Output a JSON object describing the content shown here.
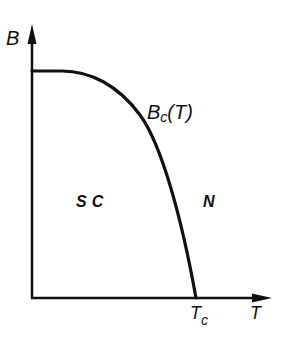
{
  "diagram": {
    "axes": {
      "y_label": "B",
      "x_label": "T"
    },
    "curve": {
      "label_main": "B",
      "label_sub": "c",
      "label_suffix": "(T)"
    },
    "regions": {
      "superconducting": "SC",
      "normal": "N"
    },
    "critical_temperature": {
      "label_main": "T",
      "label_sub": "c"
    },
    "colors": {
      "line": "#111111",
      "background": "#ffffff"
    }
  }
}
